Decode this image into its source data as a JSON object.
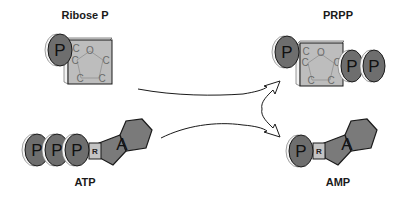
{
  "diagram": {
    "molecules": {
      "ribose_p": {
        "label": "Ribose P",
        "phosphate": "P",
        "ring_atoms": [
          "C",
          "O",
          "C",
          "C",
          "C",
          "C"
        ]
      },
      "atp": {
        "label": "ATP",
        "phosphates": [
          "P",
          "P",
          "P"
        ],
        "ribose": "R",
        "base": "A"
      },
      "prpp": {
        "label": "PRPP",
        "phosphate_left": "P",
        "phosphates_right": [
          "P",
          "P"
        ],
        "ring_atoms": [
          "C",
          "O",
          "C",
          "C",
          "C",
          "C"
        ]
      },
      "amp": {
        "label": "AMP",
        "phosphate": "P",
        "ribose": "R",
        "base": "A"
      }
    },
    "arrows": [
      {
        "from": "Ribose P",
        "to": "PRPP"
      },
      {
        "from": "ATP",
        "to": "AMP"
      }
    ],
    "colors": {
      "phosphate_fill": "#6e6e6e",
      "sugar_fill": "#bdbdbd",
      "base_fill": "#7a7a7a",
      "ribose_box_fill": "#c4c4c4",
      "outline": "#1a1a1a",
      "background": "#ffffff"
    }
  }
}
